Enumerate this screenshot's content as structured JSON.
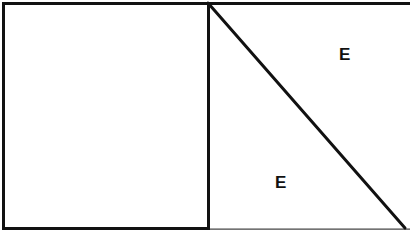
{
  "figure": {
    "type": "geometry-diagram",
    "width": 410,
    "height": 235,
    "background_color": "#ffffff",
    "stroke_color": "#111111",
    "labels": [
      {
        "id": "upper",
        "text": "E",
        "x": 345,
        "y": 57
      },
      {
        "id": "lower",
        "text": "E",
        "x": 281,
        "y": 184
      }
    ],
    "shapes": {
      "outer_rectangle": {
        "name": "outer-rectangle",
        "x": 3.5,
        "y": 3.5,
        "width": 403,
        "height": 225,
        "stroke_width": 3,
        "note": "open on right side"
      },
      "vertical_divider": {
        "name": "vertical-divider",
        "x1": 208,
        "y1": 3,
        "x2": 208,
        "y2": 229,
        "stroke_width": 3
      },
      "diagonal_line": {
        "name": "diagonal-line",
        "x1": 208,
        "y1": 3,
        "x2": 405,
        "y2": 228,
        "stroke_width": 3
      },
      "left_square": {
        "name": "left-square",
        "x": 3,
        "y": 3,
        "width": 205,
        "height": 226
      },
      "baseline_extension": {
        "name": "baseline-extension",
        "x1": 208,
        "y1": 229,
        "x2": 409,
        "y2": 229,
        "stroke_width": 1.2
      }
    }
  }
}
